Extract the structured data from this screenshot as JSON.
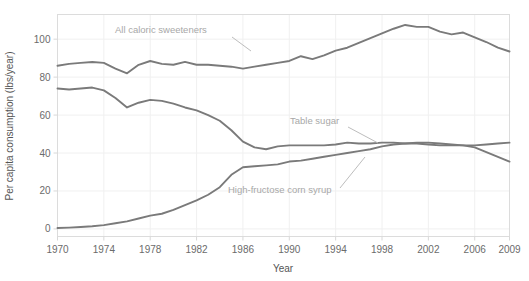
{
  "chart_data": {
    "type": "line",
    "title": "",
    "xlabel": "Year",
    "ylabel": "Per capita consumption (lbs/year)",
    "xlim": [
      1970,
      2009
    ],
    "ylim": [
      -4,
      113
    ],
    "xticks": [
      1970,
      1974,
      1978,
      1982,
      1986,
      1990,
      1994,
      1998,
      2002,
      2006,
      2009
    ],
    "yticks": [
      0,
      20,
      40,
      60,
      80,
      100
    ],
    "grid": "faint",
    "legend_position": "inline-annotations",
    "x": [
      1970,
      1971,
      1972,
      1973,
      1974,
      1975,
      1976,
      1977,
      1978,
      1979,
      1980,
      1981,
      1982,
      1983,
      1984,
      1985,
      1986,
      1987,
      1988,
      1989,
      1990,
      1991,
      1992,
      1993,
      1994,
      1995,
      1996,
      1997,
      1998,
      1999,
      2000,
      2001,
      2002,
      2003,
      2004,
      2005,
      2006,
      2007,
      2008,
      2009
    ],
    "series": [
      {
        "name": "All caloric sweeteners",
        "color": "#7a7a7a",
        "values": [
          86.0,
          87.0,
          87.5,
          88.0,
          87.5,
          84.5,
          82.0,
          86.5,
          88.5,
          87.0,
          86.5,
          88.0,
          86.5,
          86.5,
          86.0,
          85.5,
          84.5,
          85.5,
          86.5,
          87.5,
          88.5,
          91.0,
          89.5,
          91.5,
          94.0,
          95.5,
          98.0,
          100.5,
          103.0,
          105.5,
          107.5,
          106.5,
          106.5,
          104.0,
          102.5,
          103.5,
          101.0,
          98.5,
          95.5,
          93.5
        ]
      },
      {
        "name": "Table sugar",
        "color": "#7a7a7a",
        "values": [
          74.0,
          73.5,
          74.0,
          74.5,
          73.0,
          69.0,
          64.0,
          66.5,
          68.0,
          67.5,
          66.0,
          64.0,
          62.5,
          60.0,
          57.0,
          52.0,
          46.0,
          43.0,
          42.0,
          43.5,
          44.0,
          44.0,
          44.0,
          44.0,
          44.5,
          45.5,
          45.0,
          45.0,
          45.5,
          45.5,
          45.0,
          45.0,
          44.5,
          44.0,
          44.0,
          44.0,
          44.0,
          44.5,
          45.0,
          45.5
        ]
      },
      {
        "name": "High-fructose corn syrup",
        "color": "#7a7a7a",
        "values": [
          0.5,
          0.7,
          1.0,
          1.4,
          2.0,
          3.0,
          4.0,
          5.5,
          7.0,
          8.0,
          10.0,
          12.5,
          15.0,
          18.0,
          22.0,
          28.5,
          32.5,
          33.0,
          33.5,
          34.0,
          35.5,
          36.0,
          37.0,
          38.0,
          39.0,
          40.0,
          41.0,
          42.0,
          43.5,
          44.5,
          45.0,
          45.5,
          45.5,
          45.0,
          44.5,
          44.0,
          43.0,
          40.5,
          38.0,
          35.5
        ]
      }
    ],
    "annotations": [
      {
        "label": "All caloric sweeteners",
        "text_x": 115,
        "text_y": 33,
        "leader": [
          [
            232,
            37
          ],
          [
            251,
            51
          ]
        ]
      },
      {
        "label": "Table sugar",
        "text_x": 290,
        "text_y": 124,
        "leader": [
          [
            348,
            127
          ],
          [
            378,
            143
          ]
        ]
      },
      {
        "label": "High-fructose corn syrup",
        "text_x": 228,
        "text_y": 193,
        "leader": [
          [
            340,
            188
          ],
          [
            365,
            157
          ]
        ]
      }
    ]
  },
  "axis": {
    "y_title": "Per capita consumption (lbs/year)",
    "x_title": "Year",
    "x_tick_labels": [
      "1970",
      "1974",
      "1978",
      "1982",
      "1986",
      "1990",
      "1994",
      "1998",
      "2002",
      "2006",
      "2009"
    ],
    "y_tick_labels": [
      "0",
      "20",
      "40",
      "60",
      "80",
      "100"
    ]
  },
  "colors": {
    "line": "#7a7a7a",
    "annotation_text": "#a8a8a8",
    "annotation_leader": "#bdbdbd",
    "tick_text": "#6b6b6b",
    "axis_title": "#555555",
    "grid": "#f0f0f0",
    "frame": "#d8d8d8",
    "background": "#ffffff"
  }
}
